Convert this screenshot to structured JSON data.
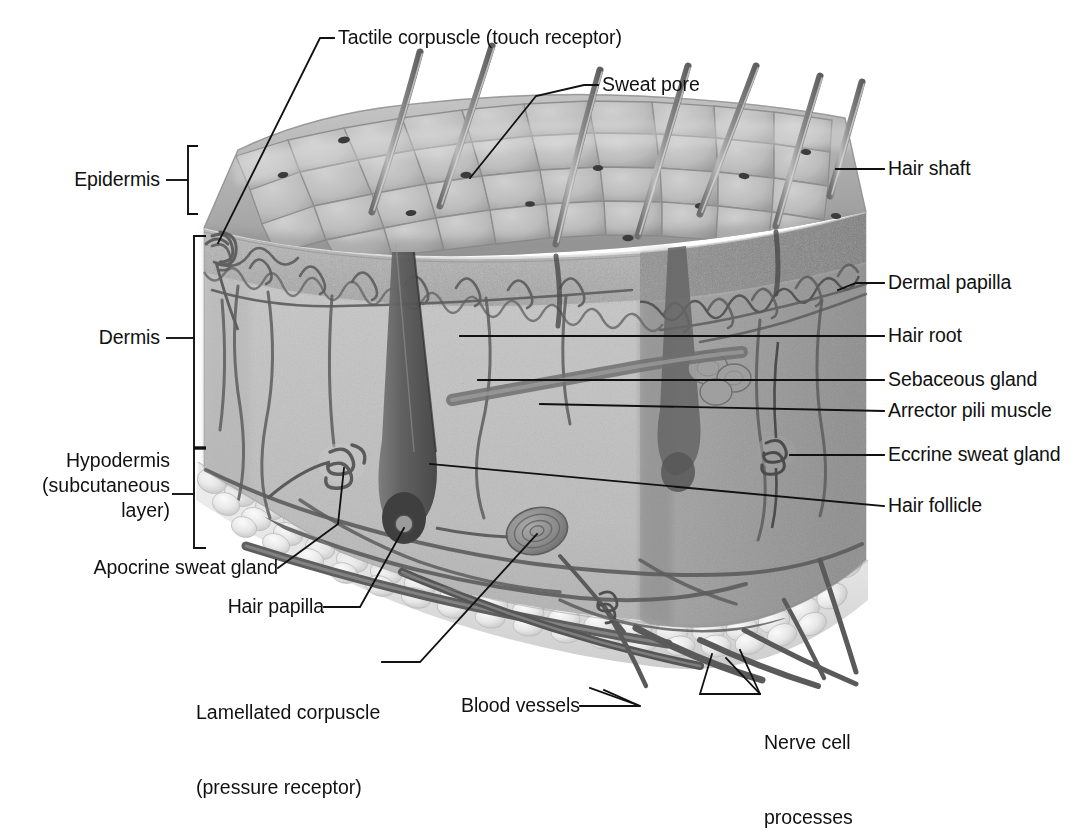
{
  "figure": {
    "type": "anatomical cross-section block diagram",
    "view": "three-dimensional cutaway block of skin",
    "style": "grayscale pencil / airbrush medical illustration",
    "background_color": "#ffffff",
    "ink_color": "#111111"
  },
  "brackets": [
    {
      "name": "epidermis-bracket",
      "label_key": "epidermis"
    },
    {
      "name": "dermis-hypodermis-bracket",
      "label_key": "dermis_hypodermis"
    }
  ],
  "layer_labels": [
    {
      "id": "epidermis",
      "text": "Epidermis",
      "align": "right",
      "lines": [
        "Epidermis"
      ]
    },
    {
      "id": "dermis",
      "text": "Dermis",
      "align": "right",
      "lines": [
        "Dermis"
      ]
    },
    {
      "id": "hypodermis",
      "text": "Hypodermis (subcutaneous layer)",
      "align": "right",
      "lines": [
        "Hypodermis",
        "(subcutaneous",
        "layer)"
      ]
    }
  ],
  "labels_top": [
    {
      "id": "tactile_corpuscle",
      "text": "Tactile corpuscle (touch receptor)",
      "align": "left"
    },
    {
      "id": "sweat_pore",
      "text": "Sweat pore",
      "align": "left"
    }
  ],
  "labels_right": [
    {
      "id": "hair_shaft",
      "text": "Hair shaft",
      "align": "left"
    },
    {
      "id": "dermal_papilla",
      "text": "Dermal papilla",
      "align": "left"
    },
    {
      "id": "hair_root",
      "text": "Hair root",
      "align": "left"
    },
    {
      "id": "sebaceous_gland",
      "text": "Sebaceous gland",
      "align": "left"
    },
    {
      "id": "arrector_pili_muscle",
      "text": "Arrector pili muscle",
      "align": "left"
    },
    {
      "id": "eccrine_sweat_gland",
      "text": "Eccrine sweat gland",
      "align": "left"
    },
    {
      "id": "hair_follicle",
      "text": "Hair follicle",
      "align": "left"
    }
  ],
  "labels_left": [
    {
      "id": "apocrine_sweat_gland",
      "text": "Apocrine sweat gland",
      "align": "right"
    },
    {
      "id": "hair_papilla",
      "text": "Hair papilla",
      "align": "right"
    },
    {
      "id": "lamellated_corpuscle",
      "text": "Lamellated corpuscle (pressure receptor)",
      "align": "right",
      "lines": [
        "Lamellated corpuscle",
        "(pressure receptor)"
      ]
    }
  ],
  "labels_bottom": [
    {
      "id": "blood_vessels",
      "text": "Blood vessels",
      "align": "right"
    },
    {
      "id": "nerve_cell_processes",
      "text": "Nerve cell processes",
      "align": "left",
      "lines": [
        "Nerve cell",
        "processes"
      ]
    }
  ],
  "label_text": {
    "epidermis": "Epidermis",
    "dermis": "Dermis",
    "hypodermis_l1": "Hypodermis",
    "hypodermis_l2": "(subcutaneous",
    "hypodermis_l3": "layer)",
    "tactile_corpuscle": "Tactile corpuscle (touch receptor)",
    "sweat_pore": "Sweat pore",
    "hair_shaft": "Hair shaft",
    "dermal_papilla": "Dermal papilla",
    "hair_root": "Hair root",
    "sebaceous_gland": "Sebaceous gland",
    "arrector_pili_muscle": "Arrector pili muscle",
    "eccrine_sweat_gland": "Eccrine sweat gland",
    "hair_follicle": "Hair follicle",
    "apocrine_sweat_gland": "Apocrine sweat gland",
    "hair_papilla": "Hair papilla",
    "lamellated_corpuscle_l1": "Lamellated corpuscle",
    "lamellated_corpuscle_l2": "(pressure receptor)",
    "blood_vessels": "Blood vessels",
    "nerve_cell_l1": "Nerve cell",
    "nerve_cell_l2": "processes"
  },
  "structures_depicted": [
    "stratified polygonal skin surface with sweat pores",
    "seven emerging hair shafts",
    "epidermis band with wavy dermo-epidermal junction",
    "dermis with capillary loops and nerve fibers",
    "coiled eccrine sweat glands",
    "hair follicles with bulb and papilla",
    "sebaceous gland",
    "arrector pili muscle",
    "apocrine sweat gland",
    "lamellated (Pacinian) corpuscle",
    "hypodermis adipose lobules",
    "blood vessels and nerve trunks at the base"
  ]
}
